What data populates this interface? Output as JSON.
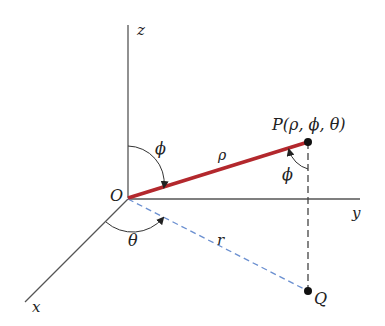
{
  "diagram": {
    "labels": {
      "z_axis": "z",
      "y_axis": "y",
      "x_axis": "x",
      "origin": "O",
      "point_p": "P(ρ, ϕ, θ)",
      "point_q": "Q",
      "rho": "ρ",
      "r": "r",
      "phi_top": "ϕ",
      "phi_at_p": "ϕ",
      "theta": "θ"
    },
    "colors": {
      "rho_segment": "#b3282d",
      "r_segment": "#6a8fd0",
      "axes": "#555555",
      "vertical_dashed": "#444444"
    }
  }
}
